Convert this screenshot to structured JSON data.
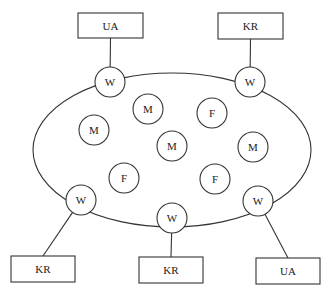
{
  "diagram": {
    "colors": {
      "stroke": "#333333",
      "background": "#ffffff",
      "text": "#222222"
    },
    "ring": {
      "cx": 172,
      "cy": 150,
      "rx": 139,
      "ry": 77
    },
    "boxes": [
      {
        "id": "box-top-left",
        "label": "UA",
        "x": 78,
        "y": 13,
        "w": 65,
        "h": 25,
        "connects_to": "w-top-left"
      },
      {
        "id": "box-top-right",
        "label": "KR",
        "x": 218,
        "y": 13,
        "w": 65,
        "h": 26,
        "connects_to": "w-top-right"
      },
      {
        "id": "box-bottom-left",
        "label": "KR",
        "x": 11,
        "y": 256,
        "w": 64,
        "h": 26,
        "connects_to": "w-bottom-left"
      },
      {
        "id": "box-bottom-middle",
        "label": "KR",
        "x": 139,
        "y": 257,
        "w": 64,
        "h": 26,
        "connects_to": "w-bottom-middle"
      },
      {
        "id": "box-bottom-right",
        "label": "UA",
        "x": 256,
        "y": 258,
        "w": 64,
        "h": 26,
        "connects_to": "w-bottom-right"
      }
    ],
    "ring_nodes": [
      {
        "id": "w-top-left",
        "label": "W",
        "cx": 110,
        "cy": 82,
        "r": 15
      },
      {
        "id": "w-top-right",
        "label": "W",
        "cx": 250,
        "cy": 82,
        "r": 15
      },
      {
        "id": "w-bottom-left",
        "label": "W",
        "cx": 81,
        "cy": 200,
        "r": 15
      },
      {
        "id": "w-bottom-middle",
        "label": "W",
        "cx": 172,
        "cy": 218,
        "r": 15
      },
      {
        "id": "w-bottom-right",
        "label": "W",
        "cx": 258,
        "cy": 201,
        "r": 15
      }
    ],
    "inner_nodes": [
      {
        "id": "m-1",
        "label": "M",
        "cx": 148,
        "cy": 109,
        "r": 15
      },
      {
        "id": "f-1",
        "label": "F",
        "cx": 212,
        "cy": 113,
        "r": 15
      },
      {
        "id": "m-2",
        "label": "M",
        "cx": 94,
        "cy": 130,
        "r": 15
      },
      {
        "id": "m-3",
        "label": "M",
        "cx": 172,
        "cy": 146,
        "r": 15
      },
      {
        "id": "m-4",
        "label": "M",
        "cx": 253,
        "cy": 147,
        "r": 15
      },
      {
        "id": "f-2",
        "label": "F",
        "cx": 124,
        "cy": 178,
        "r": 15
      },
      {
        "id": "f-3",
        "label": "F",
        "cx": 215,
        "cy": 179,
        "r": 15
      }
    ]
  }
}
